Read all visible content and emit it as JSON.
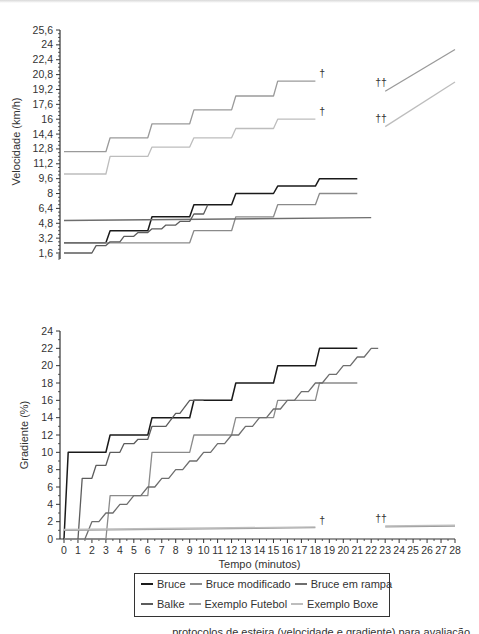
{
  "colors": {
    "bruce": "#1a1a1a",
    "bruce_modificado": "#8a8a8a",
    "bruce_em_rampa": "#6e6e6e",
    "balke": "#5c5c5c",
    "exemplo_futebol": "#9a9a9a",
    "exemplo_boxe": "#bdbdbd",
    "axis": "#333333"
  },
  "legend": {
    "items": [
      {
        "label": "Bruce",
        "key": "bruce"
      },
      {
        "label": "Bruce modificado",
        "key": "bruce_modificado"
      },
      {
        "label": "Bruce em rampa",
        "key": "bruce_em_rampa"
      },
      {
        "label": "Balke",
        "key": "balke"
      },
      {
        "label": "Exemplo Futebol",
        "key": "exemplo_futebol"
      },
      {
        "label": "Exemplo Boxe",
        "key": "exemplo_boxe"
      }
    ]
  },
  "caption": "... protocolos de esteira (velocidade e gradiente) para avaliação",
  "annotations": {
    "dagger": "†",
    "double_dagger": "††"
  },
  "chart_data": [
    {
      "type": "line",
      "title": "",
      "xlabel": "",
      "ylabel": "Velocidade (km/h)",
      "ylim": [
        1.6,
        25.6
      ],
      "xlim": [
        0,
        28
      ],
      "yticks": [
        "1,6",
        "3,2",
        "4,8",
        "6,4",
        "8",
        "9,6",
        "11,2",
        "12,8",
        "14,4",
        "16",
        "17,6",
        "19,2",
        "20,8",
        "22,4",
        "24",
        "25,6"
      ],
      "grid": false,
      "series": [
        {
          "name": "Bruce",
          "x": [
            0,
            3,
            3.3,
            6,
            6.3,
            9,
            9.3,
            12,
            12.3,
            15,
            15.3,
            18,
            18.3,
            21
          ],
          "y": [
            2.7,
            2.7,
            4.0,
            4.0,
            5.5,
            5.5,
            6.8,
            6.8,
            8.0,
            8.0,
            8.8,
            8.8,
            9.6,
            9.6
          ]
        },
        {
          "name": "Bruce modificado",
          "x": [
            0,
            3,
            3.3,
            6,
            6.3,
            9,
            9.3,
            12,
            12.3,
            15,
            15.3,
            18,
            18.3,
            21
          ],
          "y": [
            2.7,
            2.7,
            2.7,
            2.7,
            2.7,
            2.7,
            4.0,
            4.0,
            5.5,
            5.5,
            6.8,
            6.8,
            8.0,
            8.0
          ]
        },
        {
          "name": "Bruce em rampa",
          "x": [
            0,
            22
          ],
          "y": [
            5.1,
            5.4
          ]
        },
        {
          "name": "Balke",
          "x": [
            0,
            2,
            2.3,
            3,
            3.3,
            4,
            4.3,
            5,
            5.3,
            6,
            6.3,
            7,
            7.3,
            8,
            8.3,
            9,
            9.3,
            10,
            10.3
          ],
          "y": [
            1.6,
            1.6,
            2.4,
            2.4,
            2.8,
            2.8,
            3.4,
            3.4,
            3.8,
            3.8,
            4.2,
            4.2,
            4.6,
            4.6,
            5.0,
            5.0,
            5.8,
            5.8,
            6.8
          ]
        },
        {
          "name": "Exemplo Futebol",
          "x": [
            0,
            3,
            3.3,
            6,
            6.3,
            9,
            9.3,
            12,
            12.3,
            15,
            15.3,
            18
          ],
          "y": [
            12.5,
            12.5,
            14.0,
            14.0,
            15.5,
            15.5,
            17.0,
            17.0,
            18.5,
            18.5,
            20.1,
            20.1
          ],
          "end_marker": "†",
          "continuation": {
            "x": [
              23,
              28
            ],
            "y": [
              19.0,
              23.5
            ],
            "marker": "††"
          }
        },
        {
          "name": "Exemplo Boxe",
          "x": [
            0,
            3,
            3.3,
            6,
            6.3,
            9,
            9.3,
            12,
            12.3,
            15,
            15.3,
            18
          ],
          "y": [
            10.1,
            10.1,
            12.0,
            12.0,
            13.0,
            13.0,
            14.0,
            14.0,
            15.0,
            15.0,
            16.0,
            16.0
          ],
          "end_marker": "†",
          "continuation": {
            "x": [
              23,
              28
            ],
            "y": [
              15.2,
              20.0
            ],
            "marker": "††"
          }
        }
      ]
    },
    {
      "type": "line",
      "title": "",
      "xlabel": "Tempo (minutos)",
      "ylabel": "Gradiente (%)",
      "ylim": [
        0,
        24
      ],
      "xlim": [
        0,
        28
      ],
      "yticks": [
        "0",
        "2",
        "4",
        "6",
        "8",
        "10",
        "12",
        "14",
        "16",
        "18",
        "20",
        "22",
        "24"
      ],
      "xticks": [
        "0",
        "1",
        "2",
        "3",
        "4",
        "5",
        "6",
        "7",
        "8",
        "9",
        "10",
        "11",
        "12",
        "13",
        "14",
        "15",
        "16",
        "17",
        "18",
        "19",
        "20",
        "21",
        "22",
        "23",
        "24",
        "25",
        "26",
        "27",
        "28"
      ],
      "grid": false,
      "series": [
        {
          "name": "Bruce",
          "x": [
            0,
            0.3,
            3,
            3.3,
            6,
            6.3,
            9,
            9.3,
            12,
            12.3,
            15,
            15.3,
            18,
            18.3,
            21
          ],
          "y": [
            0,
            10,
            10,
            12,
            12,
            14,
            14,
            16,
            16,
            18,
            18,
            20,
            20,
            22,
            22
          ]
        },
        {
          "name": "Bruce modificado",
          "x": [
            0,
            3,
            3.3,
            6,
            6.3,
            9,
            9.3,
            12,
            12.3,
            15,
            15.3,
            18,
            18.3,
            21
          ],
          "y": [
            0,
            0,
            5,
            5,
            10,
            10,
            12,
            12,
            14,
            14,
            16,
            16,
            18,
            18
          ]
        },
        {
          "name": "Bruce em rampa",
          "x": [
            1.5,
            2,
            2.5,
            3,
            3.5,
            4,
            4.5,
            5,
            5.5,
            6,
            6.5,
            7,
            7.5,
            8,
            8.5,
            9,
            9.5,
            10,
            10.5,
            11,
            11.5,
            12,
            12.5,
            13,
            13.5,
            14,
            14.5,
            15,
            15.5,
            16,
            16.5,
            17,
            17.5,
            18,
            18.5,
            19,
            19.5,
            20,
            20.5,
            21,
            21.5,
            22,
            22.5
          ],
          "y": [
            0,
            2,
            2,
            3,
            3,
            4,
            4,
            5,
            5,
            6,
            6,
            7,
            7,
            8,
            8,
            9,
            9,
            10,
            10,
            11,
            11,
            12,
            12,
            13,
            13,
            14,
            14,
            15,
            15,
            16,
            16,
            17,
            17,
            18,
            18,
            19,
            19,
            20,
            20,
            21,
            21,
            22,
            22
          ]
        },
        {
          "name": "Balke",
          "x": [
            1,
            1.3,
            2,
            2.3,
            3,
            3.3,
            4,
            4.3,
            5,
            5.3,
            6,
            6.3,
            7,
            7.3,
            8,
            8.3,
            9,
            9.3,
            10
          ],
          "y": [
            0,
            7,
            7,
            8.5,
            8.5,
            10,
            10,
            11,
            11,
            11.5,
            11.5,
            13,
            13,
            13,
            14.5,
            14.5,
            16,
            16,
            16
          ]
        },
        {
          "name": "Exemplo Futebol",
          "x": [
            0,
            18
          ],
          "y": [
            1.0,
            1.3
          ],
          "end_marker": "†",
          "continuation": {
            "x": [
              23,
              28
            ],
            "y": [
              1.4,
              1.5
            ],
            "marker": "††"
          }
        },
        {
          "name": "Exemplo Boxe",
          "x": [
            0,
            18
          ],
          "y": [
            1.1,
            1.4
          ],
          "continuation": {
            "x": [
              23,
              28
            ],
            "y": [
              1.5,
              1.6
            ]
          }
        }
      ]
    }
  ]
}
